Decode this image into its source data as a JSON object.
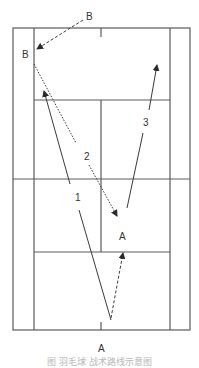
{
  "diagram": {
    "type": "badminton-court-shot-diagram",
    "colors": {
      "court_line": "#5a5a5a",
      "shot_line": "#3a3a3a",
      "label": "#333333",
      "caption": "#b8b8b8"
    },
    "players": [
      {
        "id": "B-start",
        "label": "B",
        "x": 89,
        "y": 19
      },
      {
        "id": "B-end",
        "label": "B",
        "x": 26,
        "y": 58
      },
      {
        "id": "A-mid",
        "label": "A",
        "x": 123,
        "y": 240
      },
      {
        "id": "A-start",
        "label": "A",
        "x": 101,
        "y": 352
      }
    ],
    "shots": [
      {
        "number": "1",
        "style": "solid",
        "from": [
          111,
          320
        ],
        "to": [
          44,
          91
        ],
        "label_pos": [
          78,
          201
        ]
      },
      {
        "number": "2",
        "style": "dotted",
        "from": [
          34,
          64
        ],
        "to": [
          117,
          216
        ],
        "label_pos": [
          87,
          160
        ]
      },
      {
        "number": "3",
        "style": "solid",
        "from": [
          127,
          208
        ],
        "to": [
          157,
          65
        ],
        "label_pos": [
          147,
          126
        ]
      },
      {
        "number": "",
        "style": "dashed",
        "from": [
          111,
          318
        ],
        "to": [
          123,
          253
        ],
        "label_pos": null
      },
      {
        "number": "",
        "style": "dashed",
        "from": [
          83,
          20
        ],
        "to": [
          37,
          49
        ],
        "label_pos": null
      }
    ],
    "labels": {
      "shot1": "1",
      "shot2": "2",
      "shot3": "3",
      "playerB_top": "B",
      "playerB_side": "B",
      "playerA_mid": "A",
      "playerA_bottom": "A"
    },
    "caption": "图 羽毛球 战术路线示意图"
  }
}
